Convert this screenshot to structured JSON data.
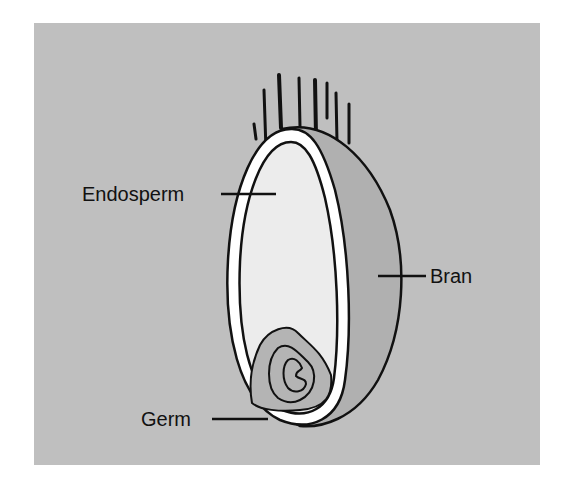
{
  "diagram": {
    "colors": {
      "background_panel": "#bfbfbf",
      "bran": "#b0b0b0",
      "seed_coat": "#ffffff",
      "endosperm": "#ececec",
      "germ": "#b4b4b4",
      "outline": "#111111"
    },
    "labels": [
      {
        "id": "endosperm",
        "text": "Endosperm"
      },
      {
        "id": "bran",
        "text": "Bran"
      },
      {
        "id": "germ",
        "text": "Germ"
      }
    ]
  }
}
